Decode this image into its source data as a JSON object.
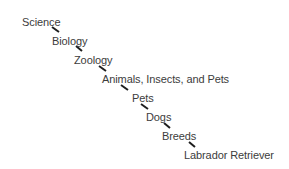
{
  "diagram": {
    "type": "hierarchy-path",
    "nodes": [
      {
        "label": "Science",
        "x": 22,
        "y": 16
      },
      {
        "label": "Biology",
        "x": 52,
        "y": 35
      },
      {
        "label": "Zoology",
        "x": 74,
        "y": 54
      },
      {
        "label": "Animals, Insects, and Pets",
        "x": 102,
        "y": 73
      },
      {
        "label": "Pets",
        "x": 132,
        "y": 92
      },
      {
        "label": "Dogs",
        "x": 146,
        "y": 111
      },
      {
        "label": "Breeds",
        "x": 162,
        "y": 130
      },
      {
        "label": "Labrador Retriever",
        "x": 184,
        "y": 149
      }
    ],
    "connectors": [
      {
        "x1": 52,
        "y1": 27,
        "x2": 59,
        "y2": 32
      },
      {
        "x1": 76,
        "y1": 46,
        "x2": 82,
        "y2": 51
      },
      {
        "x1": 99,
        "y1": 66,
        "x2": 106,
        "y2": 71
      },
      {
        "x1": 121,
        "y1": 85,
        "x2": 128,
        "y2": 90
      },
      {
        "x1": 141,
        "y1": 104,
        "x2": 148,
        "y2": 109
      },
      {
        "x1": 164,
        "y1": 123,
        "x2": 170,
        "y2": 128
      },
      {
        "x1": 189,
        "y1": 142,
        "x2": 195,
        "y2": 147
      }
    ],
    "text_color": "#3c3c3c",
    "connector_color": "#1e1e1e"
  }
}
